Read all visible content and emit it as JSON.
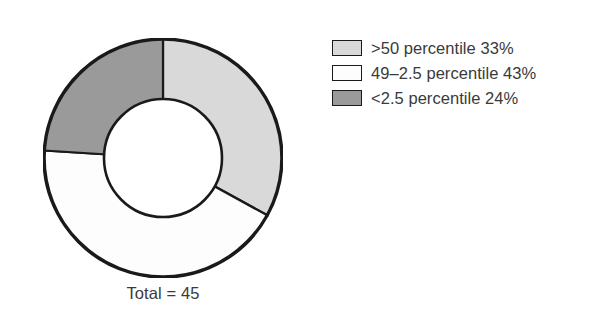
{
  "chart_data": {
    "type": "pie",
    "variant": "donut",
    "title": "",
    "subtitle": "",
    "xlabel": "",
    "ylabel": "",
    "total_label": "Total = 45",
    "total_value": 45,
    "legend_position": "right",
    "grid": false,
    "start_angle_deg": 0,
    "direction": "clockwise",
    "categories": [
      ">50 percentile",
      "49–2.5 percentile",
      "<2.5 percentile"
    ],
    "values": [
      33,
      43,
      24
    ],
    "value_unit": "%",
    "colors": [
      "#d9d9d9",
      "#fdfdfd",
      "#9a9a9a"
    ],
    "stroke_color": "#1a1a1a",
    "slices": [
      {
        "label": ">50 percentile",
        "value": 33,
        "display": ">50 percentile 33%",
        "color": "#d9d9d9",
        "start_deg": 0,
        "end_deg": 118.8
      },
      {
        "label": "49–2.5 percentile",
        "value": 43,
        "display": "49–2.5 percentile 43%",
        "color": "#fdfdfd",
        "start_deg": 118.8,
        "end_deg": 273.6
      },
      {
        "label": "<2.5 percentile",
        "value": 24,
        "display": "<2.5 percentile 24%",
        "color": "#9a9a9a",
        "start_deg": 273.6,
        "end_deg": 360
      }
    ]
  },
  "legend": {
    "items": [
      {
        "label": ">50 percentile 33%",
        "color": "#d9d9d9",
        "swatch_name": "legend-swatch-above-50-percentile"
      },
      {
        "label": "49–2.5 percentile 43%",
        "color": "#fdfdfd",
        "swatch_name": "legend-swatch-49-to-2point5-percentile"
      },
      {
        "label": "<2.5 percentile 24%",
        "color": "#9a9a9a",
        "swatch_name": "legend-swatch-below-2point5-percentile"
      }
    ]
  },
  "caption": {
    "total": "Total = 45"
  }
}
